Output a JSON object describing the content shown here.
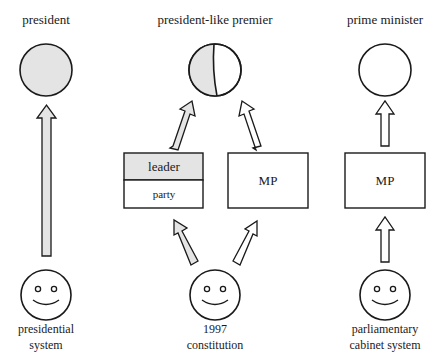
{
  "colors": {
    "fill_gray": "#e4e4e4",
    "stroke": "#1a1a1a",
    "background": "#ffffff"
  },
  "columns": [
    {
      "id": "presidential",
      "title": "president",
      "circle_fill": "full-gray",
      "arrows": [
        {
          "from": "voter",
          "to": "president",
          "fill": "gray"
        }
      ],
      "boxes": [],
      "voter_label": [
        "presidential",
        "system"
      ]
    },
    {
      "id": "1997-constitution",
      "title": "president-like premier",
      "circle_fill": "half-gray",
      "boxes": [
        {
          "id": "leader-party",
          "top_label": "leader",
          "bottom_label": "party"
        },
        {
          "id": "mp",
          "label": "MP"
        }
      ],
      "arrows": [
        {
          "from": "voter",
          "to": "leader",
          "fill": "gray"
        },
        {
          "from": "voter",
          "to": "MP",
          "fill": "white"
        },
        {
          "from": "leader",
          "to": "premier",
          "fill": "gray"
        },
        {
          "from": "MP",
          "to": "premier",
          "fill": "white"
        }
      ],
      "voter_label": [
        "1997",
        "constitution"
      ]
    },
    {
      "id": "parliamentary",
      "title": "prime minister",
      "circle_fill": "white",
      "boxes": [
        {
          "id": "mp",
          "label": "MP"
        }
      ],
      "arrows": [
        {
          "from": "voter",
          "to": "MP",
          "fill": "white"
        },
        {
          "from": "MP",
          "to": "prime minister",
          "fill": "white"
        }
      ],
      "voter_label": [
        "parliamentary",
        "cabinet system"
      ]
    }
  ]
}
